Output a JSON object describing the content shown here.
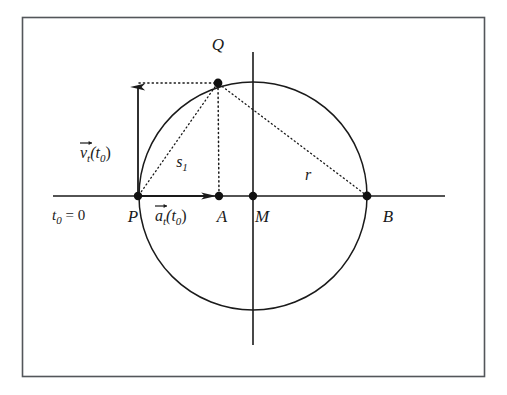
{
  "figure": {
    "title_alt": "Circle diagram with tangential velocity and acceleration vectors at point P",
    "background_color": "#ffffff",
    "ink_color": "#1a1a1a",
    "frame": {
      "x": 22,
      "y": 17,
      "width": 463,
      "height": 360,
      "stroke": "#4a4a4a"
    }
  },
  "geometry": {
    "circle": {
      "cx": 253,
      "cy": 196,
      "r": 114,
      "stroke": "#1a1a1a"
    },
    "horizontal_axis": {
      "x1": 53,
      "y1": 196,
      "x2": 445,
      "y2": 196
    },
    "vertical_axis": {
      "x1": 253,
      "y1": 52,
      "x2": 253,
      "y2": 345
    },
    "points": [
      {
        "id": "P",
        "x": 138,
        "y": 196
      },
      {
        "id": "A",
        "x": 219,
        "y": 196
      },
      {
        "id": "M",
        "x": 253,
        "y": 196
      },
      {
        "id": "B",
        "x": 367,
        "y": 196
      },
      {
        "id": "Q",
        "x": 218,
        "y": 83
      }
    ],
    "velocity_vector": {
      "from_x": 138,
      "from_y": 196,
      "to_x": 138,
      "to_y": 83
    },
    "acceleration_vector": {
      "from_x": 138,
      "from_y": 196,
      "to_x": 217,
      "to_y": 196
    },
    "dotted_lines": [
      {
        "name": "q-to-velocity-tip",
        "x1": 138,
        "y1": 83,
        "x2": 218,
        "y2": 83
      },
      {
        "name": "q-to-a",
        "x1": 218,
        "y1": 83,
        "x2": 219,
        "y2": 196
      },
      {
        "name": "chord-p-to-q",
        "x1": 138,
        "y1": 196,
        "x2": 218,
        "y2": 83
      },
      {
        "name": "chord-q-to-b",
        "x1": 218,
        "y1": 83,
        "x2": 367,
        "y2": 196
      }
    ]
  },
  "labels": {
    "point_P": "P",
    "point_A": "A",
    "point_M": "M",
    "point_B": "B",
    "point_Q": "Q",
    "chord_s1_base": "s",
    "chord_s1_sub": "1",
    "radius_r": "r",
    "time_t0": "t",
    "time_t0_sub": "0",
    "time_t0_eq": " = 0",
    "velocity_vec_base": "v",
    "velocity_vec_sub": "t",
    "velocity_vec_arg_open": "(t",
    "velocity_vec_arg_sub": "0",
    "velocity_vec_arg_close": ")",
    "accel_vec_base": "a",
    "accel_vec_sub": "t",
    "accel_vec_arg_open": "(t",
    "accel_vec_arg_sub": "0",
    "accel_vec_arg_close": ")"
  }
}
